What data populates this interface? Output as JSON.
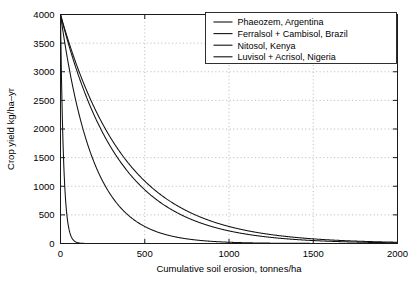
{
  "chart_data": {
    "type": "line",
    "title": "",
    "xlabel": "Cumulative soil erosion, tonnes/ha",
    "ylabel": "Crop yield kg/ha–yr",
    "xlim": [
      0,
      2000
    ],
    "ylim": [
      0,
      4000
    ],
    "xticks": [
      0,
      500,
      1000,
      1500,
      2000
    ],
    "yticks": [
      0,
      500,
      1000,
      1500,
      2000,
      2500,
      3000,
      3500,
      4000
    ],
    "xticklabels": [
      "0",
      "500",
      "1000",
      "1500",
      "2000"
    ],
    "yticklabels": [
      "0",
      "500",
      "1000",
      "1500",
      "2000",
      "2500",
      "3000",
      "3500",
      "4000"
    ],
    "grid": true,
    "grid_style": "dotted",
    "legend_position": "upper-right",
    "x": [
      0,
      25,
      50,
      75,
      100,
      150,
      200,
      250,
      300,
      350,
      400,
      450,
      500,
      550,
      600,
      650,
      700,
      750,
      800,
      850,
      900,
      950,
      1000,
      1100,
      1200,
      1300,
      1400,
      1500,
      1600,
      1700,
      1800,
      1900,
      2000
    ],
    "series": [
      {
        "name": "Phaeozem, Argentina",
        "decay_constant_per_tonne_ha": 0.055,
        "y0": 4000,
        "values": [
          4000,
          1012,
          256,
          65,
          16,
          1,
          0,
          0,
          0,
          0,
          0,
          0,
          0,
          0,
          0,
          0,
          0,
          0,
          0,
          0,
          0,
          0,
          0,
          0,
          0,
          0,
          0,
          0,
          0,
          0,
          0,
          0,
          0
        ]
      },
      {
        "name": "Ferralsol + Cambisol, Brazil",
        "decay_constant_per_tonne_ha": 0.0052,
        "y0": 4000,
        "values": [
          4000,
          3513,
          3085,
          2709,
          2379,
          1834,
          1414,
          1090,
          840,
          648,
          499,
          385,
          297,
          229,
          176,
          136,
          105,
          81,
          62,
          48,
          37,
          28,
          22,
          13,
          8,
          5,
          3,
          2,
          1,
          1,
          0,
          0,
          0
        ]
      },
      {
        "name": "Nitosol, Kenya",
        "decay_constant_per_tonne_ha": 0.0029,
        "y0": 4000,
        "values": [
          4000,
          3720,
          3460,
          3219,
          2994,
          2590,
          2240,
          1938,
          1676,
          1450,
          1254,
          1085,
          938,
          812,
          702,
          607,
          525,
          454,
          393,
          340,
          294,
          254,
          220,
          165,
          123,
          92,
          69,
          51,
          38,
          29,
          22,
          16,
          12
        ]
      },
      {
        "name": "Luvisol + Acrisol, Nigeria",
        "decay_constant_per_tonne_ha": 0.0026,
        "y0": 4000,
        "values": [
          4000,
          3748,
          3512,
          3292,
          3086,
          2711,
          2381,
          2092,
          1837,
          1614,
          1417,
          1245,
          1093,
          960,
          843,
          741,
          650,
          571,
          502,
          441,
          387,
          340,
          299,
          230,
          178,
          137,
          106,
          81,
          63,
          48,
          37,
          29,
          22
        ]
      }
    ]
  },
  "legend": {
    "items": [
      {
        "label": "Phaeozem, Argentina"
      },
      {
        "label": "Ferralsol + Cambisol, Brazil"
      },
      {
        "label": "Nitosol, Kenya"
      },
      {
        "label": "Luvisol + Acrisol, Nigeria"
      }
    ]
  },
  "colors": {
    "curve": "#111111",
    "axis": "#1a1a1a",
    "grid": "#9a9a9a",
    "background": "#ffffff"
  }
}
